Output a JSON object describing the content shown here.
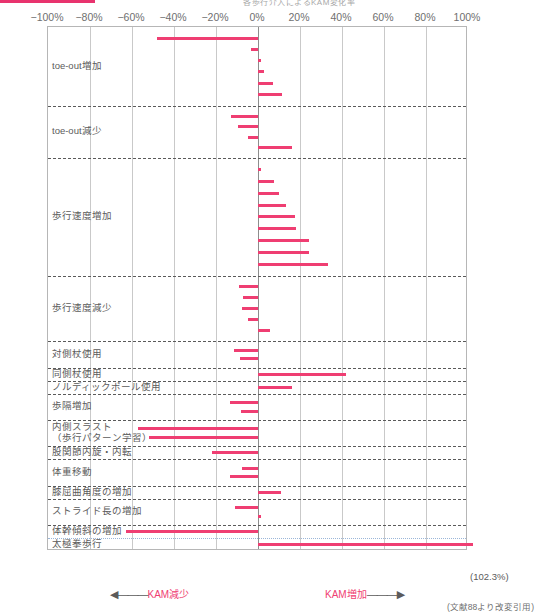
{
  "meta": {
    "top_title_fragment": "各歩行介入によるKAM変化率",
    "accent_color": "#ef3e72",
    "axis_color": "#b6b6b6",
    "grid_color": "#c9c9c9"
  },
  "chart_data": {
    "type": "bar",
    "orientation": "horizontal",
    "title": "各歩行介入によるKAM変化率",
    "xlabel": "",
    "ylabel": "",
    "xlim": [
      -100,
      100
    ],
    "grid": true,
    "legend": "none",
    "xtick_labels": [
      "−100%",
      "−80%",
      "−60%",
      "−40%",
      "−20%",
      "0%",
      "20%",
      "40%",
      "60%",
      "80%",
      "100%"
    ],
    "xtick_values": [
      -100,
      -80,
      -60,
      -40,
      -20,
      0,
      20,
      40,
      60,
      80,
      100
    ],
    "axis_left_annotation": "KAM減少",
    "axis_right_annotation": "KAM増加",
    "citation": "(文献88より改変引用)",
    "overflow_value_label": "(102.3%)",
    "categories": [
      {
        "label": "toe-out増加",
        "values": [
          -48.0,
          -3.5,
          1.5,
          3.0,
          7.0,
          11.5
        ]
      },
      {
        "label": "toe-out減少",
        "values": [
          -13.0,
          -9.5,
          -5.0,
          16.0
        ]
      },
      {
        "label": "歩行速度増加",
        "values": [
          1.5,
          7.5,
          10.0,
          13.5,
          17.5,
          18.0,
          24.5,
          24.5,
          33.5
        ]
      },
      {
        "label": "歩行速度減少",
        "values": [
          -9.0,
          -7.0,
          -7.5,
          -5.0,
          5.5
        ]
      },
      {
        "label": "対側杖使用",
        "values": [
          -11.5,
          -8.5
        ]
      },
      {
        "label": "同側杖使用",
        "values": [
          42.0
        ]
      },
      {
        "label": "ノルディックポール使用",
        "values": [
          16.0
        ]
      },
      {
        "label": "歩隔増加",
        "values": [
          -13.5,
          -8.0
        ]
      },
      {
        "label": "内側スラスト\n（歩行パターン学習）",
        "values": [
          -57.0,
          -52.0
        ]
      },
      {
        "label": "股関節内旋・内転",
        "values": [
          -22.0
        ]
      },
      {
        "label": "体重移動",
        "values": [
          -7.5,
          -13.5
        ]
      },
      {
        "label": "膝屈曲角度の増加",
        "values": [
          11.0
        ]
      },
      {
        "label": "ストライド長の増加",
        "values": [
          -11.0,
          1.5
        ]
      },
      {
        "label": "体幹傾斜の増加",
        "values": [
          -63.0
        ]
      },
      {
        "label": "太極拳歩行",
        "values": [
          102.3
        ]
      }
    ]
  }
}
